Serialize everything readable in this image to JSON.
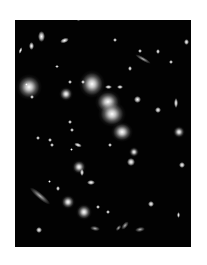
{
  "image": {
    "description": "Deep-field astronomical photograph of a galaxy cluster with bright elliptical galaxies and gravitationally lensed arcs",
    "background_color": "#ffffff",
    "field_color": "#020202",
    "field_bounds": {
      "left": 15,
      "top": 20,
      "width": 176,
      "height": 227
    }
  },
  "objects": [
    {
      "type": "glow",
      "x": 29,
      "y": 87,
      "w": 26,
      "h": 26,
      "rot": 0
    },
    {
      "type": "glow",
      "x": 92,
      "y": 84,
      "w": 26,
      "h": 28,
      "rot": 0
    },
    {
      "type": "glow",
      "x": 108,
      "y": 102,
      "w": 26,
      "h": 24,
      "rot": 0
    },
    {
      "type": "glow",
      "x": 112,
      "y": 114,
      "w": 28,
      "h": 26,
      "rot": 0
    },
    {
      "type": "glow",
      "x": 122,
      "y": 132,
      "w": 22,
      "h": 20,
      "rot": 0
    },
    {
      "type": "glow",
      "x": 66,
      "y": 94,
      "w": 14,
      "h": 14,
      "rot": 0
    },
    {
      "type": "glow",
      "x": 79,
      "y": 167,
      "w": 14,
      "h": 14,
      "rot": 0
    },
    {
      "type": "glow",
      "x": 68,
      "y": 202,
      "w": 14,
      "h": 14,
      "rot": 0
    },
    {
      "type": "glow",
      "x": 84,
      "y": 212,
      "w": 16,
      "h": 16,
      "rot": 0
    },
    {
      "type": "glow",
      "x": 179,
      "y": 132,
      "w": 12,
      "h": 12,
      "rot": 0
    },
    {
      "type": "glow",
      "x": 134,
      "y": 152,
      "w": 10,
      "h": 10,
      "rot": 0
    },
    {
      "type": "dot",
      "x": 41,
      "y": 36,
      "w": 7,
      "h": 11,
      "rot": 0
    },
    {
      "type": "dot",
      "x": 31,
      "y": 46,
      "w": 5,
      "h": 8,
      "rot": 0
    },
    {
      "type": "dot",
      "x": 64,
      "y": 40,
      "w": 9,
      "h": 5,
      "rot": -20
    },
    {
      "type": "dot",
      "x": 20,
      "y": 50,
      "w": 3,
      "h": 7,
      "rot": 20
    },
    {
      "type": "dot",
      "x": 78,
      "y": 19,
      "w": 5,
      "h": 4,
      "rot": 0
    },
    {
      "type": "dot",
      "x": 115,
      "y": 40,
      "w": 4,
      "h": 4,
      "rot": 0
    },
    {
      "type": "dot",
      "x": 140,
      "y": 51,
      "w": 4,
      "h": 4,
      "rot": 0
    },
    {
      "type": "dot",
      "x": 158,
      "y": 51,
      "w": 4,
      "h": 5,
      "rot": 0
    },
    {
      "type": "dot",
      "x": 171,
      "y": 62,
      "w": 4,
      "h": 4,
      "rot": 0
    },
    {
      "type": "dot",
      "x": 130,
      "y": 68,
      "w": 4,
      "h": 5,
      "rot": 0
    },
    {
      "type": "dot",
      "x": 57,
      "y": 66,
      "w": 4,
      "h": 3,
      "rot": 0
    },
    {
      "type": "dot",
      "x": 70,
      "y": 82,
      "w": 4,
      "h": 4,
      "rot": 0
    },
    {
      "type": "dot",
      "x": 83,
      "y": 82,
      "w": 4,
      "h": 4,
      "rot": 0
    },
    {
      "type": "dot",
      "x": 108,
      "y": 87,
      "w": 7,
      "h": 4,
      "rot": 0
    },
    {
      "type": "dot",
      "x": 120,
      "y": 87,
      "w": 6,
      "h": 4,
      "rot": 0
    },
    {
      "type": "dot",
      "x": 137,
      "y": 99,
      "w": 7,
      "h": 7,
      "rot": 0
    },
    {
      "type": "dot",
      "x": 158,
      "y": 110,
      "w": 6,
      "h": 6,
      "rot": 0
    },
    {
      "type": "dot",
      "x": 176,
      "y": 103,
      "w": 4,
      "h": 10,
      "rot": 0
    },
    {
      "type": "dot",
      "x": 186,
      "y": 42,
      "w": 5,
      "h": 6,
      "rot": 0
    },
    {
      "type": "dot",
      "x": 70,
      "y": 122,
      "w": 4,
      "h": 4,
      "rot": 0
    },
    {
      "type": "dot",
      "x": 72,
      "y": 130,
      "w": 4,
      "h": 4,
      "rot": 0
    },
    {
      "type": "dot",
      "x": 32,
      "y": 97,
      "w": 4,
      "h": 4,
      "rot": 0
    },
    {
      "type": "dot",
      "x": 26,
      "y": 84,
      "w": 3,
      "h": 3,
      "rot": 0
    },
    {
      "type": "dot",
      "x": 38,
      "y": 138,
      "w": 4,
      "h": 4,
      "rot": 0
    },
    {
      "type": "dot",
      "x": 50,
      "y": 140,
      "w": 4,
      "h": 4,
      "rot": 0
    },
    {
      "type": "dot",
      "x": 52,
      "y": 145,
      "w": 4,
      "h": 4,
      "rot": 0
    },
    {
      "type": "dot",
      "x": 78,
      "y": 145,
      "w": 8,
      "h": 4,
      "rot": 20
    },
    {
      "type": "dot",
      "x": 71,
      "y": 149,
      "w": 3,
      "h": 3,
      "rot": 0
    },
    {
      "type": "dot",
      "x": 110,
      "y": 145,
      "w": 4,
      "h": 4,
      "rot": 0
    },
    {
      "type": "dot",
      "x": 131,
      "y": 162,
      "w": 8,
      "h": 8,
      "rot": 0
    },
    {
      "type": "dot",
      "x": 182,
      "y": 165,
      "w": 6,
      "h": 6,
      "rot": 0
    },
    {
      "type": "dot",
      "x": 82,
      "y": 172,
      "w": 4,
      "h": 7,
      "rot": 0
    },
    {
      "type": "dot",
      "x": 91,
      "y": 182,
      "w": 8,
      "h": 5,
      "rot": 0
    },
    {
      "type": "dot",
      "x": 58,
      "y": 188,
      "w": 4,
      "h": 5,
      "rot": 0
    },
    {
      "type": "dot",
      "x": 49,
      "y": 181,
      "w": 3,
      "h": 3,
      "rot": 0
    },
    {
      "type": "dot",
      "x": 151,
      "y": 204,
      "w": 6,
      "h": 6,
      "rot": 0
    },
    {
      "type": "dot",
      "x": 98,
      "y": 207,
      "w": 4,
      "h": 4,
      "rot": 0
    },
    {
      "type": "dot",
      "x": 108,
      "y": 212,
      "w": 4,
      "h": 4,
      "rot": 0
    },
    {
      "type": "dot",
      "x": 39,
      "y": 230,
      "w": 6,
      "h": 6,
      "rot": 0
    },
    {
      "type": "dot",
      "x": 178,
      "y": 215,
      "w": 3,
      "h": 6,
      "rot": 0
    },
    {
      "type": "arc",
      "x": 40,
      "y": 196,
      "w": 26,
      "h": 6,
      "rot": 40
    },
    {
      "type": "arc",
      "x": 143,
      "y": 59,
      "w": 18,
      "h": 4,
      "rot": 30
    },
    {
      "type": "arc",
      "x": 125,
      "y": 225,
      "w": 10,
      "h": 5,
      "rot": -50
    },
    {
      "type": "arc",
      "x": 118,
      "y": 228,
      "w": 7,
      "h": 4,
      "rot": -50
    },
    {
      "type": "arc",
      "x": 140,
      "y": 229,
      "w": 10,
      "h": 5,
      "rot": -10
    },
    {
      "type": "arc",
      "x": 95,
      "y": 228,
      "w": 10,
      "h": 5,
      "rot": 10
    }
  ]
}
